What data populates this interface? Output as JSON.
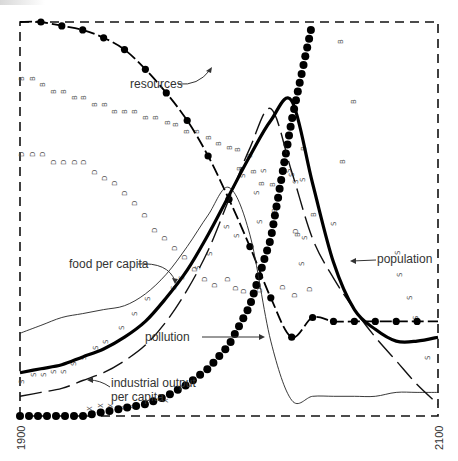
{
  "chart_data": {
    "type": "line",
    "title": "",
    "xlabel": "",
    "ylabel": "",
    "xlim": [
      1900,
      2100
    ],
    "ylim": [
      0,
      1
    ],
    "grid": false,
    "x_tick_labels": [
      "1900",
      "2100"
    ],
    "x": [
      1900,
      1910,
      1920,
      1930,
      1940,
      1950,
      1960,
      1970,
      1980,
      1990,
      2000,
      2010,
      2020,
      2030,
      2040,
      2050,
      2060,
      2070,
      2080,
      2090,
      2100
    ],
    "series": [
      {
        "name": "resources",
        "style": "dashed-dots",
        "values": [
          1.0,
          1.0,
          0.99,
          0.98,
          0.96,
          0.93,
          0.88,
          0.82,
          0.75,
          0.66,
          0.55,
          0.43,
          0.3,
          0.2,
          0.25,
          0.24,
          0.24,
          0.24,
          0.24,
          0.24,
          0.24
        ]
      },
      {
        "name": "population",
        "style": "thick",
        "values": [
          0.11,
          0.12,
          0.13,
          0.15,
          0.17,
          0.2,
          0.24,
          0.3,
          0.37,
          0.46,
          0.56,
          0.66,
          0.75,
          0.8,
          0.59,
          0.39,
          0.27,
          0.22,
          0.19,
          0.19,
          0.2
        ]
      },
      {
        "name": "food per capita",
        "style": "thin",
        "values": [
          0.21,
          0.23,
          0.25,
          0.26,
          0.27,
          0.28,
          0.31,
          0.36,
          0.43,
          0.51,
          0.58,
          0.46,
          0.19,
          0.04,
          0.05,
          0.05,
          0.05,
          0.05,
          0.06,
          0.06,
          0.06
        ]
      },
      {
        "name": "industrial output per capita",
        "style": "long-dash",
        "values": [
          0.05,
          0.06,
          0.07,
          0.09,
          0.11,
          0.14,
          0.18,
          0.24,
          0.32,
          0.42,
          0.55,
          0.68,
          0.78,
          0.62,
          0.45,
          0.35,
          0.27,
          0.2,
          0.14,
          0.08,
          0.03
        ]
      },
      {
        "name": "pollution",
        "style": "large-dots",
        "values": [
          0.0,
          0.0,
          0.0,
          0.0,
          0.01,
          0.02,
          0.03,
          0.05,
          0.08,
          0.12,
          0.18,
          0.28,
          0.45,
          0.75,
          1.0,
          1.0,
          1.0,
          1.0,
          1.0,
          1.0,
          1.0
        ]
      }
    ],
    "background_series": [
      {
        "name": "B",
        "marker": "B"
      },
      {
        "name": "D",
        "marker": "D"
      },
      {
        "name": "S",
        "marker": "S"
      },
      {
        "name": "X",
        "marker": "X"
      },
      {
        "name": "F",
        "marker": "F"
      },
      {
        "name": "R",
        "marker": "R"
      },
      {
        "name": "P",
        "marker": "P"
      },
      {
        "name": "I",
        "marker": "I"
      }
    ],
    "annotations": [
      {
        "text": "resources",
        "x": 1960,
        "y": 0.72
      },
      {
        "text": "food per capita",
        "x": 1915,
        "y": 0.42
      },
      {
        "text": "population",
        "x": 2050,
        "y": 0.42
      },
      {
        "text": "pollution",
        "x": 1942,
        "y": 0.2
      },
      {
        "text": "industrial output",
        "x": 1940,
        "y": 0.09
      },
      {
        "text": "per capita",
        "x": 1940,
        "y": 0.05
      }
    ]
  },
  "labels": {
    "resources": "resources",
    "food": "food per capita",
    "population": "population",
    "pollution": "pollution",
    "industrial1": "industrial output",
    "industrial2": "per capita",
    "x_start": "1900",
    "x_end": "2100"
  }
}
